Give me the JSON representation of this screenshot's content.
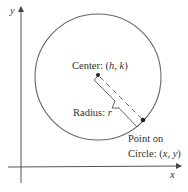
{
  "diagram": {
    "axes": {
      "x_label": "x",
      "y_label": "y"
    },
    "circle": {
      "center_label_prefix": "Center: (",
      "center_h": "h",
      "center_sep": ", ",
      "center_k": "k",
      "center_label_suffix": ")",
      "radius_label_prefix": "Radius: ",
      "radius_var": "r",
      "point_label_line1": "Point on",
      "point_label_prefix": "Circle: (",
      "point_x": "x",
      "point_sep": ", ",
      "point_y": "y",
      "point_label_suffix": ")"
    },
    "colors": {
      "stroke": "#555555",
      "text": "#333333",
      "background": "#ffffff"
    }
  }
}
